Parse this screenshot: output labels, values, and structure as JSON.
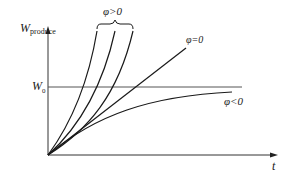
{
  "diagram": {
    "y_axis": {
      "symbol": "W",
      "subscript": "produce"
    },
    "x_axis": {
      "symbol": "t"
    },
    "reference_line": {
      "symbol": "W",
      "subscript": "0"
    },
    "curves": [
      {
        "group": "phi_positive",
        "label": "φ>0",
        "count": 3,
        "shape": "convex, increasing steeply"
      },
      {
        "group": "phi_zero",
        "label": "φ=0",
        "shape": "straight line"
      },
      {
        "group": "phi_negative",
        "label": "φ<0",
        "shape": "concave, saturating below W0"
      }
    ],
    "labels": {
      "phi_positive": "φ>0",
      "phi_zero": "φ=0",
      "phi_negative": "φ<0"
    },
    "colors": {
      "line": "#1a1a1a",
      "axis": "#333333",
      "reference": "#555555"
    }
  }
}
